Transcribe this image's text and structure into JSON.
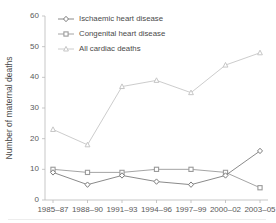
{
  "chart_data": {
    "type": "line",
    "title": "",
    "xlabel": "",
    "ylabel": "Number of maternal deaths",
    "categories": [
      "1985–87",
      "1988–90",
      "1991–93",
      "1994–96",
      "1997–99",
      "2000–02",
      "2003–05"
    ],
    "ylim": [
      0,
      60
    ],
    "yticks": [
      0,
      10,
      20,
      30,
      40,
      50,
      60
    ],
    "grid": false,
    "legend_position": "top-left-inside",
    "series": [
      {
        "name": "Ischaemic heart disease",
        "values": [
          9,
          5,
          8,
          6,
          5,
          8,
          16
        ],
        "color": "#7d7d7d",
        "marker": "diamond"
      },
      {
        "name": "Congenital heart disease",
        "values": [
          10,
          9,
          9,
          10,
          10,
          9,
          4
        ],
        "color": "#9a9a9a",
        "marker": "square"
      },
      {
        "name": "All cardiac deaths",
        "values": [
          23,
          18,
          37,
          39,
          35,
          44,
          48
        ],
        "color": "#c6c6c6",
        "marker": "triangle"
      }
    ]
  }
}
